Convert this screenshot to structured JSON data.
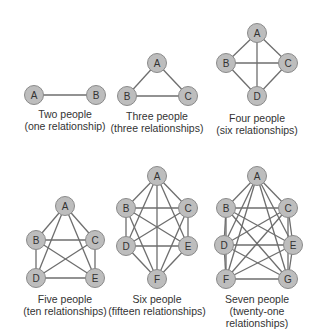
{
  "style": {
    "node_fill": "#bdbdbd",
    "node_stroke": "#8a8a8a",
    "edge_color": "#6e6e6e",
    "text_color": "#333333",
    "node_radius": 9.5
  },
  "graphs": [
    {
      "id": "two",
      "title": "Two people",
      "subtitle": "(one relationship)",
      "caption_pos": [
        65,
        108
      ],
      "nodes": [
        {
          "label": "A",
          "x": 34,
          "y": 95
        },
        {
          "label": "B",
          "x": 96,
          "y": 95
        }
      ]
    },
    {
      "id": "three",
      "title": "Three people",
      "subtitle": "(three relationships)",
      "caption_pos": [
        157,
        110
      ],
      "nodes": [
        {
          "label": "A",
          "x": 157,
          "y": 63
        },
        {
          "label": "B",
          "x": 127,
          "y": 96
        },
        {
          "label": "C",
          "x": 188,
          "y": 96
        }
      ]
    },
    {
      "id": "four",
      "title": "Four people",
      "subtitle": "(six relationships)",
      "caption_pos": [
        257,
        112
      ],
      "nodes": [
        {
          "label": "A",
          "x": 257,
          "y": 33
        },
        {
          "label": "B",
          "x": 226,
          "y": 63
        },
        {
          "label": "C",
          "x": 288,
          "y": 63
        },
        {
          "label": "D",
          "x": 257,
          "y": 96
        }
      ]
    },
    {
      "id": "five",
      "title": "Five people",
      "subtitle": "(ten relationships)",
      "caption_pos": [
        65,
        293
      ],
      "nodes": [
        {
          "label": "A",
          "x": 65,
          "y": 206
        },
        {
          "label": "B",
          "x": 36,
          "y": 240
        },
        {
          "label": "C",
          "x": 95,
          "y": 240
        },
        {
          "label": "D",
          "x": 36,
          "y": 278
        },
        {
          "label": "E",
          "x": 95,
          "y": 278
        }
      ]
    },
    {
      "id": "six",
      "title": "Six people",
      "subtitle": "(fifteen relationships)",
      "caption_pos": [
        157,
        293
      ],
      "nodes": [
        {
          "label": "A",
          "x": 157,
          "y": 176
        },
        {
          "label": "B",
          "x": 126,
          "y": 208
        },
        {
          "label": "C",
          "x": 188,
          "y": 208
        },
        {
          "label": "D",
          "x": 126,
          "y": 246
        },
        {
          "label": "E",
          "x": 188,
          "y": 246
        },
        {
          "label": "F",
          "x": 157,
          "y": 279
        }
      ]
    },
    {
      "id": "seven",
      "title": "Seven people",
      "subtitle": "(twenty-one relationships)",
      "caption_pos": [
        257,
        293
      ],
      "nodes": [
        {
          "label": "A",
          "x": 257,
          "y": 176
        },
        {
          "label": "B",
          "x": 226,
          "y": 208
        },
        {
          "label": "C",
          "x": 288,
          "y": 208
        },
        {
          "label": "D",
          "x": 224,
          "y": 245
        },
        {
          "label": "E",
          "x": 293,
          "y": 245
        },
        {
          "label": "F",
          "x": 226,
          "y": 279
        },
        {
          "label": "G",
          "x": 288,
          "y": 279
        }
      ]
    }
  ]
}
